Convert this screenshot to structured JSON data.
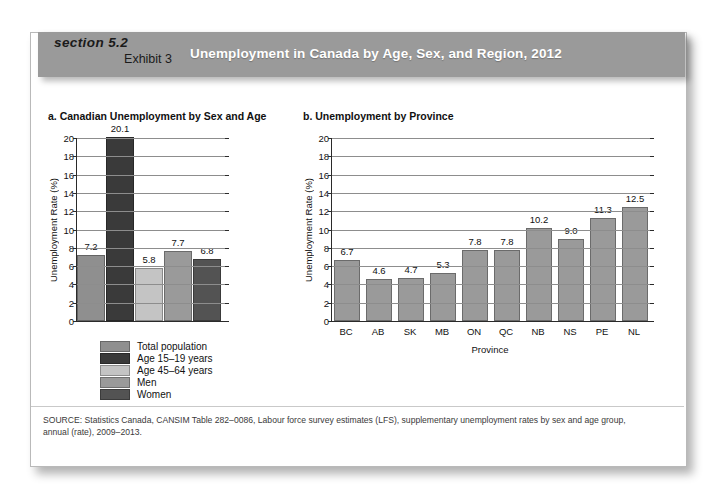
{
  "header": {
    "section": "section 5.2",
    "exhibit": "Exhibit 3",
    "title": "Unemployment in Canada by Age, Sex, and Region, 2012",
    "band_color": "#9a9a9a",
    "title_color": "#ffffff"
  },
  "source_note": "SOURCE: Statistics Canada, CANSIM Table 282–0086, Labour force survey estimates (LFS), supplementary unemployment rates by sex and age group, annual (rate), 2009–2013.",
  "legend": {
    "items": [
      {
        "label": "Total population",
        "color": "#8f8f8f"
      },
      {
        "label": "Age 15–19 years",
        "color": "#3a3a3a"
      },
      {
        "label": "Age 45–64 years",
        "color": "#c4c4c4"
      },
      {
        "label": "Men",
        "color": "#9a9a9a"
      },
      {
        "label": "Women",
        "color": "#535353"
      }
    ]
  },
  "chart_data": [
    {
      "type": "bar",
      "panel": "a",
      "title": "a. Canadian Unemployment by Sex and Age",
      "xlabel": "",
      "ylabel": "Unemployment Rate (%)",
      "ylim": [
        0,
        20
      ],
      "ytick_step": 2,
      "yticks": [
        20,
        18,
        16,
        14,
        12,
        10,
        8,
        6,
        4,
        2,
        0
      ],
      "grid": true,
      "legend_position": "below",
      "categories": [
        "Total population",
        "Age 15–19 years",
        "Age 45–64 years",
        "Men",
        "Women"
      ],
      "values": [
        7.2,
        20.1,
        5.8,
        7.7,
        6.8
      ],
      "value_labels": [
        "7.2",
        "20.1",
        "5.8",
        "7.7",
        "6.8"
      ],
      "colors": [
        "#8f8f8f",
        "#3a3a3a",
        "#c4c4c4",
        "#9a9a9a",
        "#535353"
      ]
    },
    {
      "type": "bar",
      "panel": "b",
      "title": "b. Unemployment by Province",
      "xlabel": "Province",
      "ylabel": "Unemployment Rate (%)",
      "ylim": [
        0,
        20
      ],
      "ytick_step": 2,
      "yticks": [
        20,
        18,
        16,
        14,
        12,
        10,
        8,
        6,
        4,
        2,
        0
      ],
      "grid": true,
      "legend_position": "none",
      "categories": [
        "BC",
        "AB",
        "SK",
        "MB",
        "ON",
        "QC",
        "NB",
        "NS",
        "PE",
        "NL"
      ],
      "values": [
        6.7,
        4.6,
        4.7,
        5.3,
        7.8,
        7.8,
        10.2,
        9.0,
        11.3,
        12.5
      ],
      "value_labels": [
        "6.7",
        "4.6",
        "4.7",
        "5.3",
        "7.8",
        "7.8",
        "10.2",
        "9.0",
        "11.3",
        "12.5"
      ],
      "colors": [
        "#9a9a9a",
        "#9a9a9a",
        "#9a9a9a",
        "#9a9a9a",
        "#9a9a9a",
        "#9a9a9a",
        "#9a9a9a",
        "#9a9a9a",
        "#9a9a9a",
        "#9a9a9a"
      ]
    }
  ]
}
